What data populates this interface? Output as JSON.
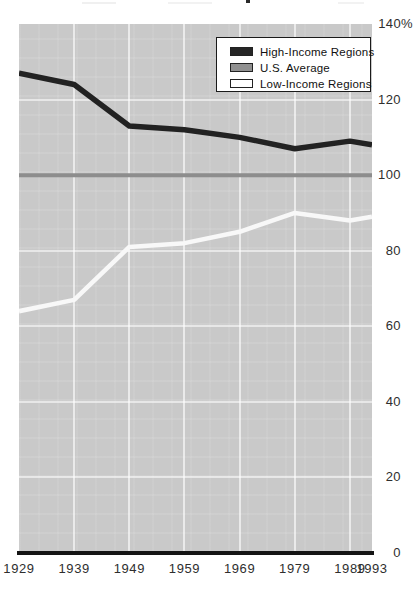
{
  "chart_data": {
    "type": "line",
    "title": "",
    "xlabel": "",
    "ylabel": "",
    "x": [
      1929,
      1939,
      1949,
      1959,
      1969,
      1979,
      1989,
      1993
    ],
    "x_tick_labels": [
      "1929",
      "1939",
      "1949",
      "1959",
      "1969",
      "1979",
      "1989",
      "1993"
    ],
    "y_tick_values": [
      0,
      20,
      40,
      60,
      80,
      100,
      120,
      140
    ],
    "y_tick_labels": [
      "0",
      "20",
      "40",
      "60",
      "80",
      "100",
      "120",
      "140%"
    ],
    "xlim": [
      1929,
      1993
    ],
    "ylim": [
      0,
      140
    ],
    "grid": true,
    "legend_position": "top-right",
    "plot_background": "#c9c9c9",
    "series": [
      {
        "name": "High-Income Regions",
        "color": "#222222",
        "values": [
          127,
          124,
          113,
          112,
          110,
          107,
          109,
          108
        ]
      },
      {
        "name": "U.S. Average",
        "color": "#8d8d8d",
        "values": [
          100,
          100,
          100,
          100,
          100,
          100,
          100,
          100
        ]
      },
      {
        "name": "Low-Income Regions",
        "color": "#f8f8f8",
        "values": [
          64,
          67,
          81,
          82,
          85,
          90,
          88,
          89
        ]
      }
    ]
  }
}
